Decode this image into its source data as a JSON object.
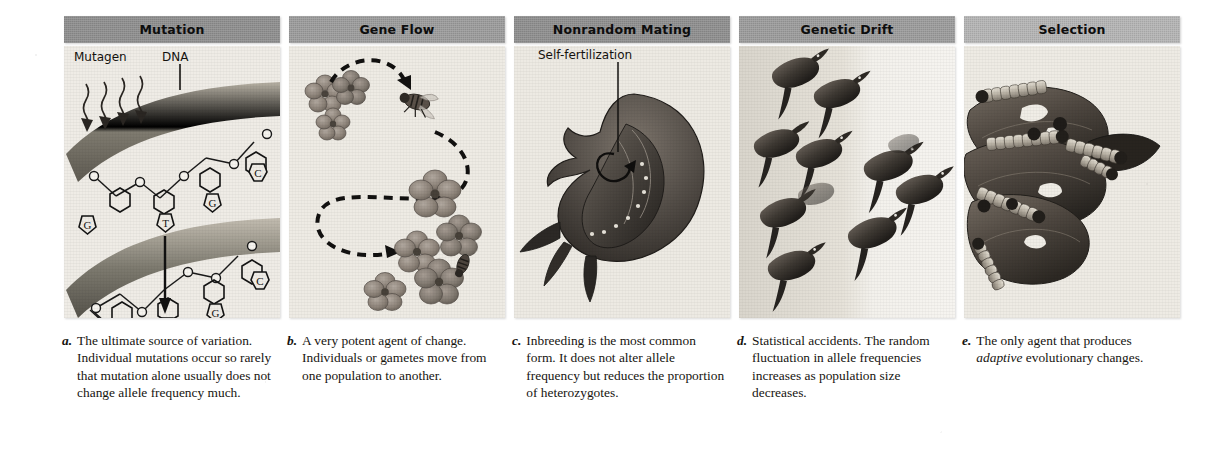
{
  "figure": {
    "kind": "textbook-figure",
    "panel_count": 5
  },
  "panels": [
    {
      "id": "mutation",
      "header": "Mutation",
      "header_tone": "#9b9b9b",
      "caption_letter": "a.",
      "caption": "The ultimate source of variation. Individual mutations occur so rarely that mutation alone usually does not change allele frequency much.",
      "labels": {
        "mutagen": "Mutagen",
        "dna": "DNA"
      },
      "bases_top": [
        "T",
        "G",
        "C"
      ],
      "bases_bottom": [
        "A",
        "G",
        "C",
        "G"
      ],
      "change": {
        "from": "T",
        "to": "A"
      }
    },
    {
      "id": "gene-flow",
      "header": "Gene Flow",
      "header_tone": "#a2a2a2",
      "caption_letter": "b.",
      "caption": "A very potent agent of change. Individuals or gametes move from one population to another.",
      "labels": {}
    },
    {
      "id": "nonrandom-mating",
      "header": "Nonrandom Mating",
      "header_tone": "#8e8e8e",
      "caption_letter": "c.",
      "caption": "Inbreeding is the most common form. It does not alter allele frequency but reduces the proportion of heterozygotes.",
      "labels": {
        "self_fertilization": "Self-fertilization"
      }
    },
    {
      "id": "genetic-drift",
      "header": "Genetic Drift",
      "header_tone": "#9b9b9b",
      "caption_letter": "d.",
      "caption": "Statistical accidents. The random fluctuation in allele frequencies increases as population size decreases.",
      "labels": {},
      "birds_left": 7,
      "birds_right": 4
    },
    {
      "id": "selection",
      "header": "Selection",
      "header_tone": "#b4b4b4",
      "caption_letter": "e.",
      "caption_parts": [
        {
          "text": "The only agent that produces ",
          "italic": false
        },
        {
          "text": "adaptive",
          "italic": true
        },
        {
          "text": " evolutionary changes.",
          "italic": false
        }
      ],
      "labels": {}
    }
  ]
}
